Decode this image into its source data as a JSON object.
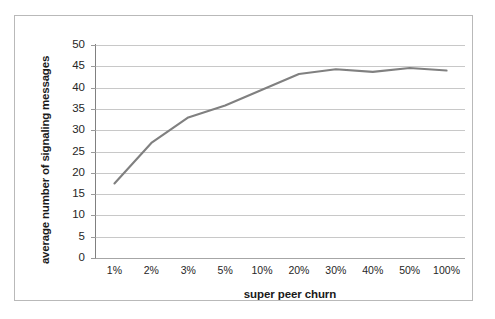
{
  "figure": {
    "background_color": "#ffffff",
    "border_color": "#b9b9b9",
    "scan_artifact_text": "",
    "series_color": "#808080",
    "gridline_color": "#c8c8c8",
    "axis_color": "#808080"
  },
  "chart_data": {
    "type": "line",
    "title": "",
    "xlabel": "super peer churn",
    "ylabel": "average number of signaling messages",
    "categories": [
      "1%",
      "2%",
      "3%",
      "5%",
      "10%",
      "20%",
      "30%",
      "40%",
      "50%",
      "100%"
    ],
    "values": [
      17.5,
      27.0,
      33.0,
      35.8,
      39.5,
      43.2,
      44.3,
      43.7,
      44.6,
      44.0
    ],
    "series": [
      {
        "name": "average number of signaling messages",
        "values": [
          17.5,
          27.0,
          33.0,
          35.8,
          39.5,
          43.2,
          44.3,
          43.7,
          44.6,
          44.0
        ],
        "color": "#808080"
      }
    ],
    "ylim": [
      0,
      50
    ],
    "ytick_values": [
      0,
      5,
      10,
      15,
      20,
      25,
      30,
      35,
      40,
      45,
      50
    ],
    "ytick_labels": [
      "0",
      "5",
      "10",
      "15",
      "20",
      "25",
      "30",
      "35",
      "40",
      "45",
      "50"
    ],
    "grid": true,
    "grid_axis": "y",
    "legend": false,
    "legend_position": "none",
    "markers": false
  }
}
